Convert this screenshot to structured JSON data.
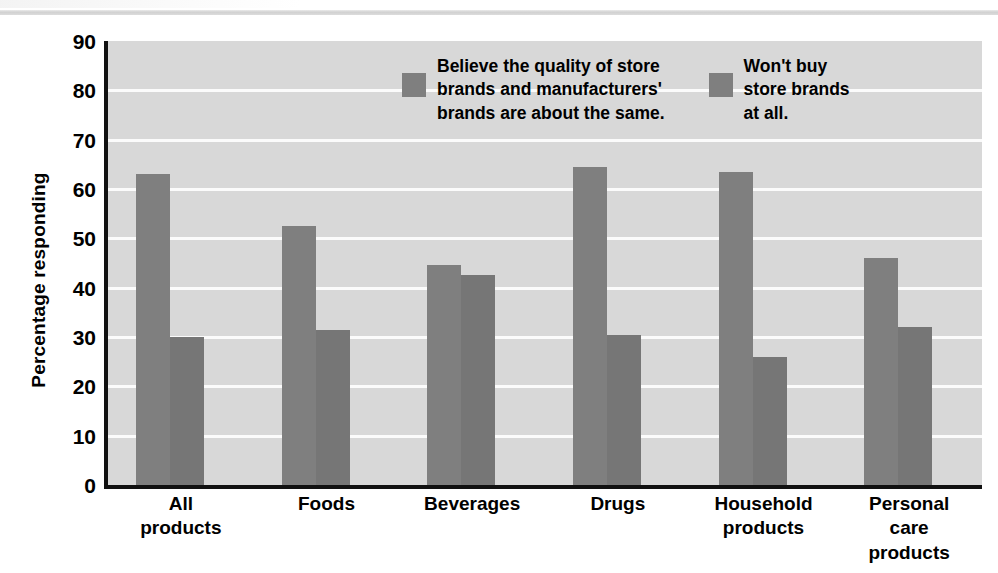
{
  "chart_data": {
    "type": "bar",
    "title": "",
    "subtitle": "",
    "xlabel": "",
    "ylabel": "Percentage responding",
    "ylim": [
      0,
      90
    ],
    "ytick_step": 10,
    "ytick_labels": [
      "90",
      "80",
      "70",
      "60",
      "50",
      "40",
      "30",
      "20",
      "10",
      "0"
    ],
    "grid": true,
    "grid_axis": "y",
    "legend_position": "inside-top-center",
    "categories": [
      "All\nproducts",
      "Foods",
      "Beverages",
      "Drugs",
      "Household\nproducts",
      "Personal\ncare\nproducts"
    ],
    "series": [
      {
        "name": "Believe the quality of store\nbrands and manufacturers'\nbrands are about the same.",
        "color": "#7f7f7f",
        "values": [
          63,
          52.5,
          44.5,
          64.5,
          63.5,
          46
        ]
      },
      {
        "name": "Won't buy\nstore brands\nat all.",
        "color": "#767676",
        "values": [
          30,
          31.5,
          42.5,
          30.5,
          26,
          32
        ]
      }
    ]
  },
  "colors": {
    "plot_background": "#d8d8d8",
    "gridline": "#fbfbfb",
    "axis": "#111111",
    "bar_series_1": "#7f7f7f",
    "bar_series_2": "#767676",
    "text": "#000000"
  }
}
